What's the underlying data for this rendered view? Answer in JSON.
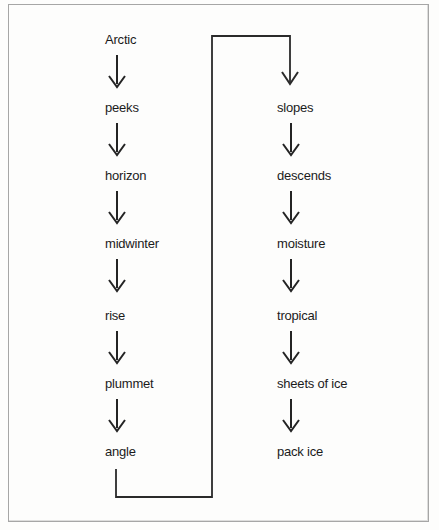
{
  "flowchart": {
    "left_items": [
      "Arctic",
      "peeks",
      "horizon",
      "midwinter",
      "rise",
      "plummet",
      "angle"
    ],
    "right_items": [
      "slopes",
      "descends",
      "moisture",
      "tropical",
      "sheets of ice",
      "pack ice"
    ],
    "connector": {
      "from": "angle",
      "to": "slopes",
      "direction": "loops from bottom-left up and over to top-right"
    },
    "colors": {
      "text": "#1b1b1b",
      "line": "#2a2a2a",
      "frame_border": "#a6a6a6",
      "background": "#fdfdfc"
    }
  }
}
